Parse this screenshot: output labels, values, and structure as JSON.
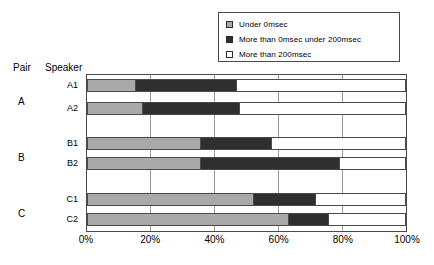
{
  "axes": {
    "pair_header": "Pair",
    "speaker_header": "Speaker",
    "xticks": [
      "0%",
      "20%",
      "40%",
      "60%",
      "80%",
      "100%"
    ]
  },
  "legend": {
    "items": [
      {
        "label": "Under 0msec",
        "swatch": "light-gray-swatch-icon",
        "color": "#a8a8a8"
      },
      {
        "label": "More than 0msec under 200msec",
        "swatch": "dark-gray-swatch-icon",
        "color": "#2e2e2e"
      },
      {
        "label": "More than 200msec",
        "swatch": "white-swatch-icon",
        "color": "#ffffff"
      }
    ]
  },
  "pairs": [
    {
      "label": "A"
    },
    {
      "label": "B"
    },
    {
      "label": "C"
    }
  ],
  "speakers": [
    {
      "label": "A1"
    },
    {
      "label": "A2"
    },
    {
      "label": "B1"
    },
    {
      "label": "B2"
    },
    {
      "label": "C1"
    },
    {
      "label": "C2"
    }
  ],
  "chart_data": {
    "type": "bar",
    "orientation": "horizontal",
    "stacked": true,
    "title": "",
    "xlabel": "",
    "ylabel": "",
    "xlim": [
      0,
      100
    ],
    "xunit": "%",
    "grid": true,
    "legend_position": "top-right",
    "categories": [
      "A1",
      "A2",
      "B1",
      "B2",
      "C1",
      "C2"
    ],
    "groups": [
      {
        "name": "A",
        "members": [
          "A1",
          "A2"
        ]
      },
      {
        "name": "B",
        "members": [
          "B1",
          "B2"
        ]
      },
      {
        "name": "C",
        "members": [
          "C1",
          "C2"
        ]
      }
    ],
    "series": [
      {
        "name": "Under 0msec",
        "color": "#a9a9a9",
        "values": [
          15,
          17.5,
          35.5,
          35.5,
          52.5,
          63.5
        ]
      },
      {
        "name": "More than 0msec under 200msec",
        "color": "#2f2f2f",
        "values": [
          32,
          30.5,
          22.5,
          44,
          19.5,
          12.5
        ]
      },
      {
        "name": "More than 200msec",
        "color": "#ffffff",
        "values": [
          53,
          52,
          42,
          20.5,
          28,
          24
        ]
      }
    ],
    "cumulative_boundaries": [
      {
        "category": "A1",
        "light_end": 15,
        "dark_end": 47
      },
      {
        "category": "A2",
        "light_end": 17.5,
        "dark_end": 48
      },
      {
        "category": "B1",
        "light_end": 35.5,
        "dark_end": 58
      },
      {
        "category": "B2",
        "light_end": 35.5,
        "dark_end": 79.5
      },
      {
        "category": "C1",
        "light_end": 52.5,
        "dark_end": 72
      },
      {
        "category": "C2",
        "light_end": 63.5,
        "dark_end": 76
      }
    ]
  }
}
